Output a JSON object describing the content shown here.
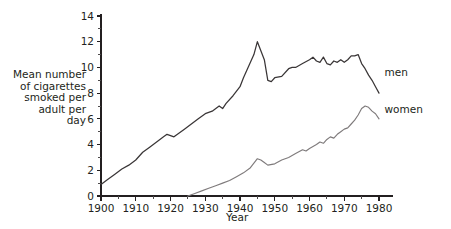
{
  "chart_data": {
    "type": "line",
    "title": "",
    "subtitle": "",
    "xlabel": "Year",
    "ylabel": "Mean number of cigarettes smoked per adult per day",
    "xlim": [
      1900,
      1982
    ],
    "ylim": [
      0,
      14
    ],
    "grid": false,
    "legend_position": "right-inline",
    "x_ticks": [
      1900,
      1910,
      1920,
      1930,
      1940,
      1950,
      1960,
      1970,
      1980
    ],
    "x_tick_labels": [
      "1900",
      "1910",
      "1920",
      "1930",
      "1940",
      "1950",
      "1960",
      "1970",
      "1980"
    ],
    "x_minor_step": 5,
    "y_ticks": [
      0,
      2,
      4,
      6,
      8,
      10,
      12,
      14
    ],
    "y_tick_labels": [
      "0",
      "2",
      "4",
      "6",
      "8",
      "10",
      "12",
      "14"
    ],
    "y_minor_step": 1,
    "series": [
      {
        "name": "men",
        "color": "#3a3637",
        "x": [
          1900,
          1902,
          1904,
          1906,
          1908,
          1910,
          1912,
          1914,
          1916,
          1918,
          1919,
          1920,
          1921,
          1922,
          1924,
          1926,
          1928,
          1930,
          1932,
          1934,
          1935,
          1936,
          1938,
          1940,
          1941,
          1942,
          1943,
          1944,
          1945,
          1946,
          1947,
          1948,
          1949,
          1950,
          1952,
          1954,
          1955,
          1956,
          1958,
          1960,
          1961,
          1962,
          1963,
          1964,
          1965,
          1966,
          1967,
          1968,
          1969,
          1970,
          1971,
          1972,
          1973,
          1974,
          1975,
          1976,
          1977,
          1978,
          1979,
          1980
        ],
        "values": [
          0.9,
          1.3,
          1.7,
          2.1,
          2.4,
          2.8,
          3.4,
          3.8,
          4.2,
          4.6,
          4.8,
          4.7,
          4.6,
          4.8,
          5.2,
          5.6,
          6.0,
          6.4,
          6.6,
          7.0,
          6.8,
          7.2,
          7.8,
          8.5,
          9.2,
          9.8,
          10.4,
          11.0,
          12.0,
          11.3,
          10.6,
          9.0,
          8.9,
          9.2,
          9.3,
          9.9,
          10.0,
          10.0,
          10.3,
          10.6,
          10.8,
          10.5,
          10.4,
          10.8,
          10.3,
          10.2,
          10.5,
          10.4,
          10.6,
          10.4,
          10.6,
          10.9,
          10.9,
          11.0,
          10.3,
          9.9,
          9.4,
          9.0,
          8.5,
          8.0
        ]
      },
      {
        "name": "women",
        "color": "#7f7b7c",
        "x": [
          1925,
          1927,
          1929,
          1931,
          1933,
          1935,
          1937,
          1939,
          1941,
          1943,
          1945,
          1946,
          1947,
          1948,
          1950,
          1952,
          1954,
          1956,
          1958,
          1959,
          1960,
          1962,
          1963,
          1964,
          1965,
          1966,
          1967,
          1968,
          1969,
          1970,
          1971,
          1972,
          1973,
          1974,
          1975,
          1976,
          1977,
          1978,
          1979,
          1980
        ],
        "values": [
          0.0,
          0.2,
          0.4,
          0.6,
          0.8,
          1.0,
          1.2,
          1.5,
          1.8,
          2.2,
          2.9,
          2.8,
          2.6,
          2.4,
          2.5,
          2.8,
          3.0,
          3.3,
          3.6,
          3.5,
          3.7,
          4.0,
          4.2,
          4.1,
          4.4,
          4.6,
          4.5,
          4.8,
          5.0,
          5.2,
          5.3,
          5.6,
          5.9,
          6.3,
          6.8,
          7.0,
          6.9,
          6.6,
          6.4,
          6.0
        ]
      }
    ],
    "annotations": [
      {
        "text": "men",
        "x": 1981,
        "y": 9.6
      },
      {
        "text": "women",
        "x": 1981,
        "y": 6.7
      }
    ]
  },
  "axis": {
    "y_title_lines": "Mean number\nof cigarettes\nsmoked per\nadult per\nday",
    "x_title": "Year"
  },
  "colors": {
    "men": "#3a3637",
    "women": "#7f7b7c",
    "axis": "#231f20",
    "background": "#ffffff"
  }
}
